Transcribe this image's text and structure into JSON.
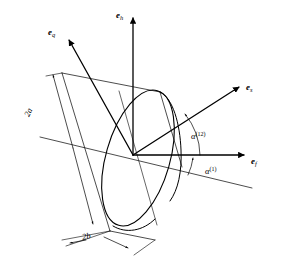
{
  "figure": {
    "type": "technical-diagram",
    "background_color": "#ffffff",
    "line_color": "#000000"
  },
  "axes": [
    {
      "id": "e_h",
      "name": "vertical-axis",
      "label_main": "e",
      "label_sub": "h",
      "from": [
        133,
        155
      ],
      "to": [
        133,
        16
      ],
      "arrow": true,
      "label_pos": [
        118,
        12
      ]
    },
    {
      "id": "e_f",
      "name": "horizontal-axis",
      "label_main": "e",
      "label_sub": "f",
      "from": [
        133,
        155
      ],
      "to": [
        247,
        155
      ],
      "arrow": true,
      "label_pos": [
        252,
        157
      ]
    },
    {
      "id": "e_s",
      "name": "s-axis",
      "label_main": "e",
      "label_sub": "s",
      "from": [
        133,
        155
      ],
      "to": [
        241,
        85
      ],
      "arrow": true,
      "label_pos": [
        246,
        86
      ]
    },
    {
      "id": "e_q",
      "name": "q-axis",
      "label_main": "e",
      "label_sub": "q",
      "from": [
        133,
        155
      ],
      "to": [
        67,
        37
      ],
      "arrow": true,
      "label_pos": [
        50,
        30
      ]
    }
  ],
  "angles": [
    {
      "id": "alpha_12",
      "name": "angle-alpha-12",
      "symbol": "α",
      "superscript": "(12)",
      "label_pos": [
        193,
        133
      ],
      "description": "Angle between the horizontal reference axis and the e_s axis"
    },
    {
      "id": "alpha_1",
      "name": "angle-alpha-1",
      "symbol": "α",
      "superscript": "(1)",
      "label_pos": [
        207,
        168
      ],
      "description": "Angle between the inclined reference line and the horizontal axis"
    }
  ],
  "dimensions": [
    {
      "id": "dim_2a",
      "name": "dimension-2a",
      "label": "2a",
      "label_pos": [
        29,
        112
      ],
      "description": "Major dimension of the disk, length 2a"
    },
    {
      "id": "dim_2b",
      "name": "dimension-2b",
      "label": "2b",
      "label_pos": [
        85,
        235
      ],
      "description": "Minor dimension / thickness of the disk, length 2b"
    }
  ],
  "shapes": {
    "disk": {
      "name": "elliptical-disk",
      "description": "Tilted ellipse representing the circular disk cross-section"
    },
    "cylinder": {
      "name": "cylinder-body",
      "description": "Parallelogram outline of the inclined cylindrical body"
    },
    "reference_line": {
      "name": "inclined-reference-line",
      "description": "Long thin line inclined below the horizontal axis"
    }
  }
}
